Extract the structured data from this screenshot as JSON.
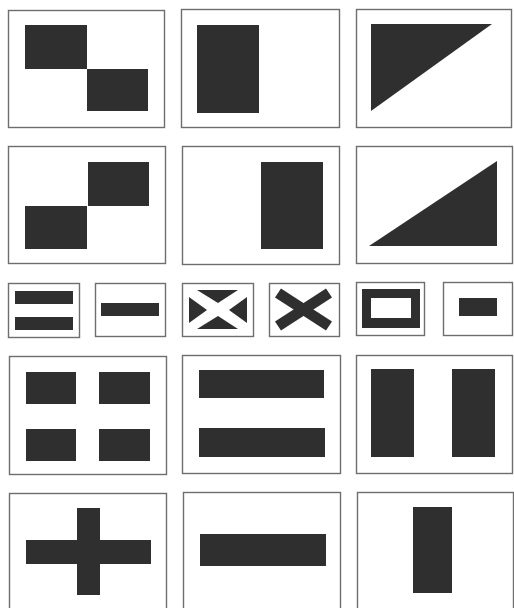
{
  "colors": {
    "background": "#ffffff",
    "frame_stroke": "#6e6e6e",
    "fill": "#2f2f2f"
  },
  "flags": [
    {
      "id": "r1c1",
      "label": "two offset rectangles (top-left, bottom-right)",
      "frame": [
        8,
        10,
        156,
        117
      ],
      "shapes": [
        {
          "type": "rect",
          "x": 25,
          "y": 25,
          "w": 62,
          "h": 44
        },
        {
          "type": "rect",
          "x": 87,
          "y": 69,
          "w": 61,
          "h": 42
        }
      ]
    },
    {
      "id": "r1c2",
      "label": "tall rectangle left",
      "frame": [
        181,
        9,
        158,
        118
      ],
      "shapes": [
        {
          "type": "rect",
          "x": 197,
          "y": 25,
          "w": 62,
          "h": 88
        }
      ]
    },
    {
      "id": "r1c3",
      "label": "triangle upper-left",
      "frame": [
        356,
        9,
        155,
        118
      ],
      "shapes": [
        {
          "type": "poly",
          "points": "371,24 492,24 371,111"
        }
      ]
    },
    {
      "id": "r2c1",
      "label": "two offset rectangles (bottom-left, top-right)",
      "frame": [
        8,
        146,
        157,
        117
      ],
      "shapes": [
        {
          "type": "rect",
          "x": 25,
          "y": 206,
          "w": 62,
          "h": 43
        },
        {
          "type": "rect",
          "x": 88,
          "y": 162,
          "w": 61,
          "h": 44
        }
      ]
    },
    {
      "id": "r2c2",
      "label": "tall rectangle right",
      "frame": [
        182,
        146,
        157,
        118
      ],
      "shapes": [
        {
          "type": "rect",
          "x": 261,
          "y": 162,
          "w": 62,
          "h": 87
        }
      ]
    },
    {
      "id": "r2c3",
      "label": "triangle lower-right",
      "frame": [
        356,
        146,
        156,
        117
      ],
      "shapes": [
        {
          "type": "poly",
          "points": "369,246 497,161 497,246"
        }
      ]
    },
    {
      "id": "r3c1",
      "label": "two horizontal bars",
      "frame": [
        8,
        283,
        71,
        54
      ],
      "shapes": [
        {
          "type": "rect",
          "x": 15,
          "y": 291,
          "w": 58,
          "h": 13
        },
        {
          "type": "rect",
          "x": 15,
          "y": 317,
          "w": 58,
          "h": 13
        }
      ]
    },
    {
      "id": "r3c2",
      "label": "single horizontal bar",
      "frame": [
        95,
        283,
        70,
        53
      ],
      "shapes": [
        {
          "type": "rect",
          "x": 101,
          "y": 303,
          "w": 58,
          "h": 13
        }
      ]
    },
    {
      "id": "r3c3",
      "label": "white saltire on dark field",
      "frame": [
        182,
        283,
        71,
        53
      ],
      "shapes": [
        {
          "type": "poly",
          "points": "197,290 238,290 218,303"
        },
        {
          "type": "poly",
          "points": "197,329 238,329 218,316"
        },
        {
          "type": "poly",
          "points": "189,297 189,323 207,310"
        },
        {
          "type": "poly",
          "points": "247,297 247,323 229,310"
        }
      ]
    },
    {
      "id": "r3c4",
      "label": "dark saltire",
      "frame": [
        269,
        283,
        70,
        53
      ],
      "shapes": [
        {
          "type": "line",
          "x1": 278,
          "y1": 293,
          "x2": 329,
          "y2": 326,
          "sw": 11
        },
        {
          "type": "line",
          "x1": 329,
          "y1": 293,
          "x2": 278,
          "y2": 326,
          "sw": 11
        }
      ]
    },
    {
      "id": "r3c5",
      "label": "hollow rectangle",
      "frame": [
        356,
        282,
        68,
        53
      ],
      "shapes": [
        {
          "type": "frame",
          "x": 362,
          "y": 289,
          "w": 58,
          "h": 39,
          "ix": 371,
          "iy": 298,
          "iw": 40,
          "ih": 20
        }
      ]
    },
    {
      "id": "r3c6",
      "label": "small centered rectangle",
      "frame": [
        443,
        282,
        69,
        53
      ],
      "shapes": [
        {
          "type": "rect",
          "x": 459,
          "y": 298,
          "w": 38,
          "h": 18
        }
      ]
    },
    {
      "id": "r4c1",
      "label": "four rectangles",
      "frame": [
        9,
        356,
        157,
        118
      ],
      "shapes": [
        {
          "type": "rect",
          "x": 26,
          "y": 372,
          "w": 50,
          "h": 32
        },
        {
          "type": "rect",
          "x": 99,
          "y": 372,
          "w": 51,
          "h": 32
        },
        {
          "type": "rect",
          "x": 26,
          "y": 429,
          "w": 50,
          "h": 32
        },
        {
          "type": "rect",
          "x": 99,
          "y": 429,
          "w": 51,
          "h": 32
        }
      ]
    },
    {
      "id": "r4c2",
      "label": "two wide horizontal bars",
      "frame": [
        182,
        355,
        158,
        118
      ],
      "shapes": [
        {
          "type": "rect",
          "x": 199,
          "y": 370,
          "w": 125,
          "h": 28
        },
        {
          "type": "rect",
          "x": 199,
          "y": 428,
          "w": 126,
          "h": 29
        }
      ]
    },
    {
      "id": "r4c3",
      "label": "two vertical bars",
      "frame": [
        356,
        355,
        156,
        118
      ],
      "shapes": [
        {
          "type": "rect",
          "x": 371,
          "y": 369,
          "w": 43,
          "h": 88
        },
        {
          "type": "rect",
          "x": 452,
          "y": 369,
          "w": 43,
          "h": 88
        }
      ]
    },
    {
      "id": "r5c1",
      "label": "cross",
      "frame": [
        9,
        493,
        157,
        130
      ],
      "shapes": [
        {
          "type": "rect",
          "x": 26,
          "y": 540,
          "w": 125,
          "h": 24
        },
        {
          "type": "rect",
          "x": 77,
          "y": 508,
          "w": 23,
          "h": 87
        }
      ]
    },
    {
      "id": "r5c2",
      "label": "single wide horizontal bar",
      "frame": [
        183,
        492,
        157,
        130
      ],
      "shapes": [
        {
          "type": "rect",
          "x": 200,
          "y": 534,
          "w": 126,
          "h": 32
        }
      ]
    },
    {
      "id": "r5c3",
      "label": "single vertical bar",
      "frame": [
        357,
        492,
        156,
        130
      ],
      "shapes": [
        {
          "type": "rect",
          "x": 413,
          "y": 507,
          "w": 39,
          "h": 86
        }
      ]
    }
  ]
}
